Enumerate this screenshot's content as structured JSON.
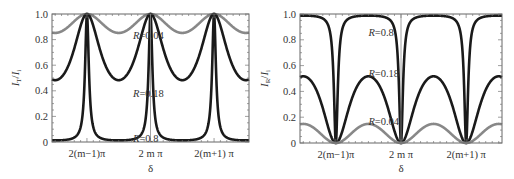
{
  "chart_data": [
    {
      "type": "line",
      "title": "",
      "ylabel": "I_T/I_i",
      "ylabel_main": "I",
      "ylabel_sub1": "T",
      "ylabel_sub2": "i",
      "xlabel": "δ",
      "ylim": [
        0,
        1.0
      ],
      "xlim_pi_units": [
        -3.1,
        3.1
      ],
      "yticks": [
        0,
        0.2,
        0.4,
        0.6,
        0.8,
        1.0
      ],
      "ytick_labels": [
        "0",
        "0.2",
        "0.4",
        "0.6",
        "0.8",
        "1.0"
      ],
      "xticks_pi_units": [
        -2,
        0,
        2
      ],
      "xtick_labels": [
        "2(m−1)π",
        "2 m π",
        "2(m+1) π"
      ],
      "function": "transmission",
      "grid": false,
      "series": [
        {
          "name": "R=0.04",
          "R": 0.04,
          "color": "#888888",
          "min_value": 0.852,
          "max_value": 1.0
        },
        {
          "name": "R=0.18",
          "R": 0.18,
          "color": "#1a1a1a",
          "min_value": 0.483,
          "max_value": 1.0
        },
        {
          "name": "R=0.8",
          "R": 0.8,
          "color": "#1a1a1a",
          "min_value": 0.012,
          "max_value": 1.0
        }
      ],
      "annotations": [
        {
          "text_prefix": "R",
          "text_value": "=0.04",
          "x_pi": -0.55,
          "y": 0.835
        },
        {
          "text_prefix": "R",
          "text_value": "=0.18",
          "x_pi": -0.55,
          "y": 0.38
        },
        {
          "text_prefix": "R",
          "text_value": "=0.8",
          "x_pi": -0.55,
          "y": 0.03
        }
      ]
    },
    {
      "type": "line",
      "title": "",
      "ylabel": "I_R/I_i",
      "ylabel_main": "I",
      "ylabel_sub1": "R",
      "ylabel_sub2": "i",
      "xlabel": "δ",
      "ylim": [
        0,
        1.0
      ],
      "xlim_pi_units": [
        -3.1,
        3.1
      ],
      "yticks": [
        0,
        0.2,
        0.4,
        0.6,
        0.8,
        1.0
      ],
      "ytick_labels": [
        "0",
        "0.2",
        "0.4",
        "0.6",
        "0.8",
        "1.0"
      ],
      "xticks_pi_units": [
        -2,
        0,
        2
      ],
      "xtick_labels": [
        "2(m−1)π",
        "2 m π",
        "2(m+1) π"
      ],
      "function": "reflection",
      "grid": false,
      "series": [
        {
          "name": "R=0.8",
          "R": 0.8,
          "color": "#1a1a1a",
          "min_value": 0.0,
          "max_value": 0.988
        },
        {
          "name": "R=0.18",
          "R": 0.18,
          "color": "#1a1a1a",
          "min_value": 0.0,
          "max_value": 0.517
        },
        {
          "name": "R=0.04",
          "R": 0.04,
          "color": "#888888",
          "min_value": 0.0,
          "max_value": 0.148
        }
      ],
      "annotations": [
        {
          "text_prefix": "R",
          "text_value": "=0.8",
          "x_pi": -1.0,
          "y": 0.86
        },
        {
          "text_prefix": "R",
          "text_value": "=0.18",
          "x_pi": -1.0,
          "y": 0.54
        },
        {
          "text_prefix": "R",
          "text_value": "=0.04",
          "x_pi": -1.0,
          "y": 0.17
        }
      ]
    }
  ]
}
